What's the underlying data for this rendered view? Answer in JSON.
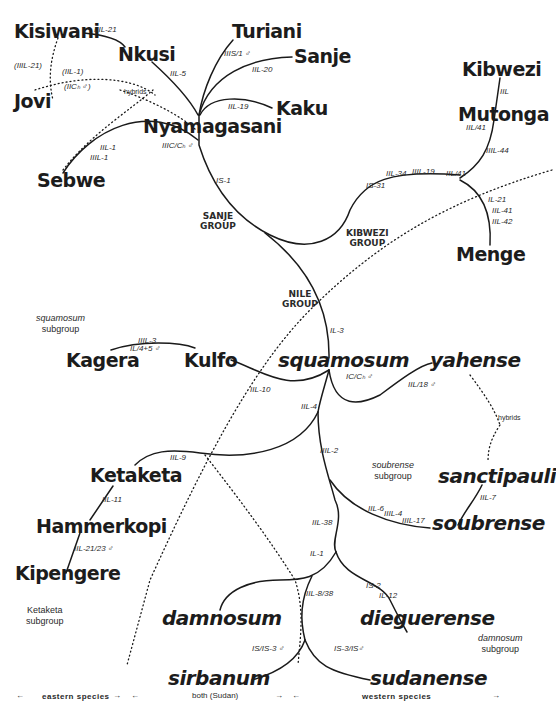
{
  "species": {
    "kisiwani": "Kisiwani",
    "nkusi": "Nkusi",
    "turiani": "Turiani",
    "sanje": "Sanje",
    "kaku": "Kaku",
    "jovi": "Jovi",
    "sebwe": "Sebwe",
    "nyamagasani": "Nyamagasani",
    "kibwezi": "Kibwezi",
    "mutonga": "Mutonga",
    "menge": "Menge",
    "kagera": "Kagera",
    "kulfo": "Kulfo",
    "squamosum": "squamosum",
    "yahense": "yahense",
    "ketaketa": "Ketaketa",
    "hammerkopi": "Hammerkopi",
    "kipengere": "Kipengere",
    "sanctipauli": "sanctipauli",
    "soubrense": "soubrense",
    "damnosum": "damnosum",
    "dieguerense": "dieguerense",
    "sirbanum": "sirbanum",
    "sudanense": "sudanense"
  },
  "cytotypes": {
    "kisiwani_nkusi": "IIIL-21",
    "jovi_paren": "(IIIL-21)",
    "jovi_iil1": "(IIL-1)",
    "jovi_iicg": "(IICₕ ♂)",
    "nkusi": "IIL-5",
    "turiani": "IIIS/1 ♂",
    "sanje": "IIL-20",
    "kaku": "IIL-19",
    "sebwe_1": "IIL-1",
    "sebwe_2": "IIIL-1",
    "nyamagasani": "IIIC/Cₕ ♂",
    "is1": "IS-1",
    "kibwezi": "IIL",
    "mutonga_a": "IIL/41",
    "mutonga_b": "IIIL-44",
    "kib_is31": "IS-31",
    "kib_iil34": "IIL-34",
    "kib_iiil19": "IIIL-19",
    "kib_node": "IIL/41",
    "menge_1": "IL-21",
    "menge_2": "IIL-41",
    "menge_3": "IIL-42",
    "il3": "IL-3",
    "kagera_kulfo_a": "IIIL-3",
    "kagera_kulfo_b": "IL/4+5 ♂",
    "kulfo": "IIL-10",
    "squamosum": "IC/Cₕ ♂",
    "yahense": "IIL/18 ♂",
    "iil4": "IIL-4",
    "iil2": "IIIL-2",
    "iil9": "IIL-9",
    "ketaketa_hammer": "IIL-11",
    "hammer_kipeng": "IIL-21/23 ♂",
    "sanctipauli": "IIL-7",
    "soub_1": "IIL-6",
    "soub_2": "IIIL-4",
    "soub_3": "IIIL-17",
    "iil38": "IIL-38",
    "il1": "IL-1",
    "iil838": "IIL-8/38",
    "dieg_1": "IS-2",
    "dieg_2": "IL-12",
    "sirbanum": "IS/IS-3 ♂",
    "sudanense": "IS-3/IS♂"
  },
  "groups": {
    "sanje": [
      "SANJE",
      "GROUP"
    ],
    "kibwezi": [
      "KIBWEZI",
      "GROUP"
    ],
    "nile": [
      "NILE",
      "GROUP"
    ]
  },
  "subgroups": {
    "squamosum": [
      "squamosum",
      "subgroup"
    ],
    "soubrense": [
      "soubrense",
      "subgroup"
    ],
    "ketaketa": [
      "Ketaketa",
      "subgroup"
    ],
    "damnosum": [
      "damnosum",
      "subgroup"
    ]
  },
  "hybrids": {
    "left": "hybrids",
    "right": "hybrids"
  },
  "footer": {
    "left_arrow": "←",
    "eastern": "eastern  species",
    "mid_arrow_r": "→",
    "mid_arrow_l": "←",
    "both": "both (Sudan)",
    "mid2_arrow_r": "→",
    "mid2_arrow_l": "←",
    "western": "western  species",
    "right_arrow": "→"
  }
}
